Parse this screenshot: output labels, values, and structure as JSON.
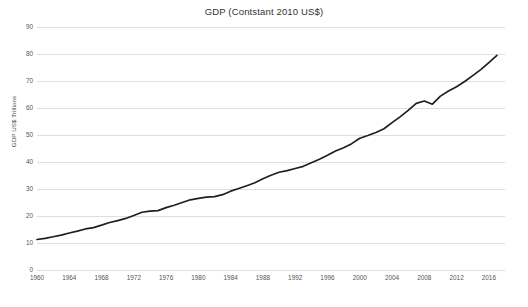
{
  "chart_data": {
    "type": "line",
    "title": "GDP (Contstant 2010 US$)",
    "xlabel": "",
    "ylabel": "GDP US$ Trillions",
    "xlim": [
      1960,
      2018
    ],
    "ylim": [
      0,
      90
    ],
    "grid": true,
    "legend": false,
    "legend_position": "none",
    "line_color": "#1f1f1f",
    "gridline_color": "#d8d8d8",
    "axis_text_color": "#555555",
    "background_color": "#ffffff",
    "ytick_labels": [
      "0",
      "10",
      "20",
      "30",
      "40",
      "50",
      "60",
      "70",
      "80",
      "90"
    ],
    "ytick_values": [
      0,
      10,
      20,
      30,
      40,
      50,
      60,
      70,
      80,
      90
    ],
    "xtick_labels": [
      "1960",
      "1964",
      "1968",
      "1972",
      "1976",
      "1980",
      "1984",
      "1988",
      "1992",
      "1996",
      "2000",
      "2004",
      "2008",
      "2012",
      "2016"
    ],
    "xtick_values": [
      1960,
      1964,
      1968,
      1972,
      1976,
      1980,
      1984,
      1988,
      1992,
      1996,
      2000,
      2004,
      2008,
      2012,
      2016
    ],
    "series": [
      {
        "name": "GDP (Constant 2010 US$)",
        "x": [
          1960,
          1961,
          1962,
          1963,
          1964,
          1965,
          1966,
          1967,
          1968,
          1969,
          1970,
          1971,
          1972,
          1973,
          1974,
          1975,
          1976,
          1977,
          1978,
          1979,
          1980,
          1981,
          1982,
          1983,
          1984,
          1985,
          1986,
          1987,
          1988,
          1989,
          1990,
          1991,
          1992,
          1993,
          1994,
          1995,
          1996,
          1997,
          1998,
          1999,
          2000,
          2001,
          2002,
          2003,
          2004,
          2005,
          2006,
          2007,
          2008,
          2009,
          2010,
          2011,
          2012,
          2013,
          2014,
          2015,
          2016,
          2017
        ],
        "y": [
          11.3,
          11.7,
          12.3,
          12.9,
          13.7,
          14.4,
          15.2,
          15.7,
          16.6,
          17.6,
          18.3,
          19.1,
          20.2,
          21.4,
          21.8,
          22.0,
          23.1,
          24.0,
          25.0,
          26.0,
          26.5,
          27.0,
          27.2,
          27.9,
          29.2,
          30.2,
          31.2,
          32.3,
          33.8,
          35.1,
          36.2,
          36.8,
          37.6,
          38.4,
          39.7,
          41.0,
          42.5,
          44.1,
          45.3,
          46.8,
          48.8,
          49.8,
          50.9,
          52.3,
          54.6,
          56.7,
          59.1,
          61.7,
          62.6,
          61.4,
          64.4,
          66.3,
          67.9,
          69.8,
          72.0,
          74.2,
          76.8,
          79.5
        ]
      }
    ],
    "notable_events": [
      {
        "year": 1975,
        "label": "oil-crisis slowdown"
      },
      {
        "year": 1982,
        "label": "early-1980s recession plateau"
      },
      {
        "year": 1991,
        "label": "early-1990s slowdown"
      },
      {
        "year": 2001,
        "label": "dot-com slowdown"
      },
      {
        "year": 2009,
        "label": "global financial crisis dip"
      }
    ]
  }
}
